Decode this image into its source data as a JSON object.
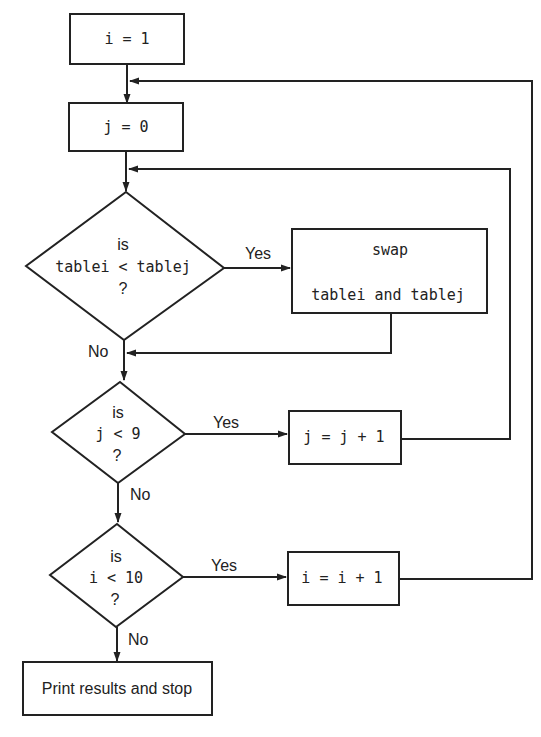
{
  "diagram": {
    "type": "flowchart",
    "colors": {
      "stroke": "#222222",
      "background": "#ffffff"
    },
    "nodes": {
      "init_i": {
        "shape": "process",
        "text": "i = 1"
      },
      "init_j": {
        "shape": "process",
        "text": "j = 0"
      },
      "compare": {
        "shape": "decision",
        "line1": "is",
        "line2": "tablei < tablej",
        "line3": "?"
      },
      "swap": {
        "shape": "process",
        "line1": "swap",
        "line2": "tablei and tablej"
      },
      "check_j": {
        "shape": "decision",
        "line1": "is",
        "line2": "j < 9",
        "line3": "?"
      },
      "inc_j": {
        "shape": "process",
        "text": "j = j + 1"
      },
      "check_i": {
        "shape": "decision",
        "line1": "is",
        "line2": "i < 10",
        "line3": "?"
      },
      "inc_i": {
        "shape": "process",
        "text": "i = i + 1"
      },
      "end": {
        "shape": "terminal",
        "text": "Print results and stop"
      }
    },
    "edge_labels": {
      "compare_yes": "Yes",
      "compare_no": "No",
      "check_j_yes": "Yes",
      "check_j_no": "No",
      "check_i_yes": "Yes",
      "check_i_no": "No"
    },
    "edges": [
      {
        "from": "init_i",
        "to": "init_j"
      },
      {
        "from": "init_j",
        "to": "compare"
      },
      {
        "from": "compare",
        "to": "swap",
        "label": "Yes"
      },
      {
        "from": "compare",
        "to": "check_j",
        "label": "No"
      },
      {
        "from": "swap",
        "to": "check_j"
      },
      {
        "from": "check_j",
        "to": "inc_j",
        "label": "Yes"
      },
      {
        "from": "inc_j",
        "to": "compare"
      },
      {
        "from": "check_j",
        "to": "check_i",
        "label": "No"
      },
      {
        "from": "check_i",
        "to": "inc_i",
        "label": "Yes"
      },
      {
        "from": "inc_i",
        "to": "init_j"
      },
      {
        "from": "check_i",
        "to": "end",
        "label": "No"
      }
    ]
  }
}
